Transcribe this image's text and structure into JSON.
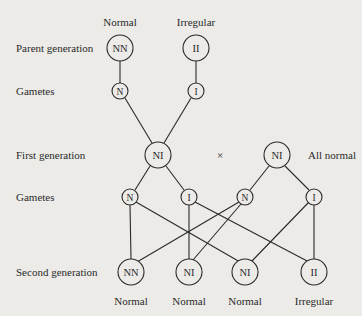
{
  "row_labels": {
    "parent": "Parent generation",
    "gametes1": "Gametes",
    "first": "First generation",
    "gametes2": "Gametes",
    "second": "Second generation"
  },
  "parent": {
    "left": {
      "phenotype": "Normal",
      "genotype": "NN"
    },
    "right": {
      "phenotype": "Irregular",
      "genotype": "II"
    }
  },
  "gametes1": [
    "N",
    "I"
  ],
  "first_generation": {
    "left": "NI",
    "cross_symbol": "×",
    "right": "NI",
    "note": "All normal"
  },
  "gametes2": [
    "N",
    "I",
    "N",
    "I"
  ],
  "second_generation": [
    {
      "genotype": "NN",
      "phenotype": "Normal"
    },
    {
      "genotype": "NI",
      "phenotype": "Normal"
    },
    {
      "genotype": "NI",
      "phenotype": "Normal"
    },
    {
      "genotype": "II",
      "phenotype": "Irregular"
    }
  ],
  "colors": {
    "background": "#ecebe8",
    "ink": "#2a2a2a"
  }
}
